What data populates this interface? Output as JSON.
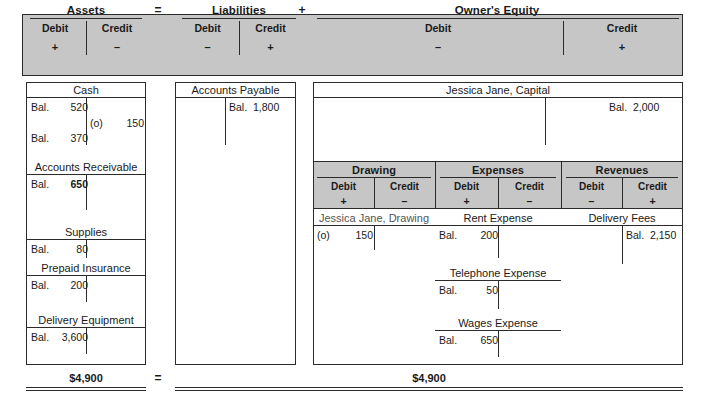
{
  "equation": {
    "groups": [
      {
        "title": "Assets",
        "debit_label": "Debit",
        "debit_sign": "+",
        "credit_label": "Credit",
        "credit_sign": "–"
      },
      {
        "title": "Liabilities",
        "debit_label": "Debit",
        "debit_sign": "–",
        "credit_label": "Credit",
        "credit_sign": "+"
      },
      {
        "title": "Owner's Equity",
        "debit_label": "Debit",
        "debit_sign": "–",
        "credit_label": "Credit",
        "credit_sign": "+"
      }
    ],
    "operators": {
      "equals": "=",
      "plus": "+"
    }
  },
  "sub_groups": [
    {
      "title": "Drawing",
      "debit_label": "Debit",
      "debit_sign": "+",
      "credit_label": "Credit",
      "credit_sign": "–"
    },
    {
      "title": "Expenses",
      "debit_label": "Debit",
      "debit_sign": "+",
      "credit_label": "Credit",
      "credit_sign": "–"
    },
    {
      "title": "Revenues",
      "debit_label": "Debit",
      "debit_sign": "–",
      "credit_label": "Credit",
      "credit_sign": "+"
    }
  ],
  "accounts": {
    "cash": {
      "name": "Cash",
      "debit_1_label": "Bal.",
      "debit_1_value": "520",
      "credit_1_label": "(o)",
      "credit_1_value": "150",
      "debit_2_label": "Bal.",
      "debit_2_value": "370"
    },
    "accounts_receivable": {
      "name": "Accounts Receivable",
      "debit_label": "Bal.",
      "debit_value": "650"
    },
    "supplies": {
      "name": "Supplies",
      "debit_label": "Bal.",
      "debit_value": "80"
    },
    "prepaid_insurance": {
      "name": "Prepaid Insurance",
      "debit_label": "Bal.",
      "debit_value": "200"
    },
    "delivery_equipment": {
      "name": "Delivery Equipment",
      "debit_label": "Bal.",
      "debit_value": "3,600"
    },
    "accounts_payable": {
      "name": "Accounts Payable",
      "credit_label": "Bal.",
      "credit_value": "1,800"
    },
    "capital": {
      "name": "Jessica Jane, Capital",
      "credit_label": "Bal.",
      "credit_value": "2,000"
    },
    "drawing": {
      "name": "Jessica Jane, Drawing",
      "debit_label": "(o)",
      "debit_value": "150"
    },
    "rent_expense": {
      "name": "Rent Expense",
      "debit_label": "Bal.",
      "debit_value": "200"
    },
    "telephone_expense": {
      "name": "Telephone Expense",
      "debit_label": "Bal.",
      "debit_value": "50"
    },
    "wages_expense": {
      "name": "Wages Expense",
      "debit_label": "Bal.",
      "debit_value": "650"
    },
    "delivery_fees": {
      "name": "Delivery Fees",
      "credit_label": "Bal.",
      "credit_value": "2,150"
    }
  },
  "totals": {
    "assets_total": "$4,900",
    "equals": "=",
    "right_total": "$4,900"
  },
  "colors": {
    "header_fill": "#c6c6c6",
    "rule": "#2b2b2b",
    "page": "#ffffff"
  }
}
